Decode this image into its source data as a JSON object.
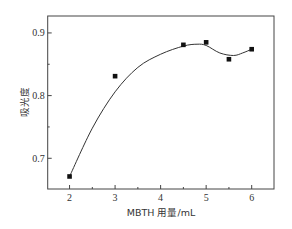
{
  "chart_data": {
    "type": "scatter",
    "title": "",
    "xlabel": "MBTH 用量/mL",
    "ylabel": "吸光度",
    "xlim": [
      1.52,
      6.49
    ],
    "ylim": [
      0.651,
      0.927
    ],
    "x_ticks": [
      2,
      3,
      4,
      5,
      6
    ],
    "x_tick_labels": [
      "2",
      "3",
      "4",
      "5",
      "6"
    ],
    "x_minor_ticks": [
      2.5,
      3.5,
      4.5,
      5.5
    ],
    "y_ticks": [
      0.7,
      0.8,
      0.9
    ],
    "y_tick_labels": [
      "0.7",
      "0.8",
      "0.9"
    ],
    "y_minor_ticks": [
      0.75,
      0.85
    ],
    "grid": false,
    "legend": null,
    "series": [
      {
        "name": "吸光度",
        "marker": "square",
        "line": "smooth spline",
        "x": [
          2,
          3,
          4.5,
          5,
          5.5,
          6
        ],
        "y": [
          0.671,
          0.831,
          0.881,
          0.885,
          0.858,
          0.874
        ]
      }
    ],
    "fit_curve": {
      "x": [
        2,
        2.5,
        3,
        3.5,
        4,
        4.5,
        4.8,
        5,
        5.3,
        5.6,
        5.8,
        6
      ],
      "y": [
        0.671,
        0.748,
        0.806,
        0.845,
        0.866,
        0.879,
        0.882,
        0.88,
        0.868,
        0.864,
        0.868,
        0.874
      ]
    },
    "colors": {
      "marker": "#111111",
      "line": "#333333",
      "axes": "#444444"
    }
  }
}
